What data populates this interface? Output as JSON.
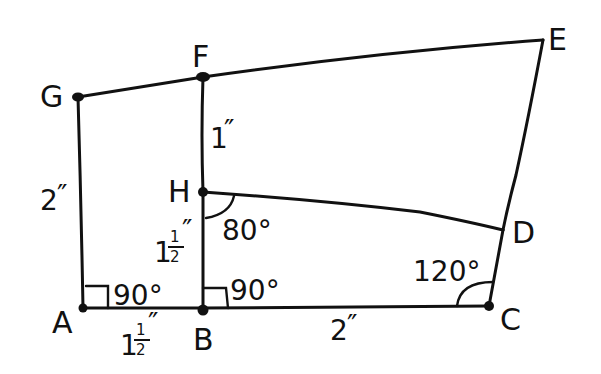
{
  "diagram": {
    "type": "hand-drawn geometry figure",
    "colors": {
      "ink": "#111111",
      "background": "#ffffff"
    },
    "points": {
      "A": {
        "label": "A"
      },
      "B": {
        "label": "B"
      },
      "C": {
        "label": "C"
      },
      "D": {
        "label": "D"
      },
      "E": {
        "label": "E"
      },
      "F": {
        "label": "F"
      },
      "G": {
        "label": "G"
      },
      "H": {
        "label": "H"
      }
    },
    "segments": [
      {
        "from": "G",
        "to": "F"
      },
      {
        "from": "F",
        "to": "E"
      },
      {
        "from": "E",
        "to": "D"
      },
      {
        "from": "D",
        "to": "C"
      },
      {
        "from": "C",
        "to": "B"
      },
      {
        "from": "B",
        "to": "A"
      },
      {
        "from": "A",
        "to": "G"
      },
      {
        "from": "F",
        "to": "H"
      },
      {
        "from": "H",
        "to": "B"
      },
      {
        "from": "H",
        "to": "D"
      }
    ],
    "lengths": {
      "AG": {
        "whole": "2",
        "mark": "″"
      },
      "FH": {
        "whole": "1",
        "mark": "″"
      },
      "HB": {
        "whole": "1",
        "num": "1",
        "den": "2",
        "mark": "″"
      },
      "AB": {
        "whole": "1",
        "num": "1",
        "den": "2",
        "mark": "″"
      },
      "BC": {
        "whole": "2",
        "mark": "″"
      }
    },
    "angles": {
      "A": "90°",
      "B": "90°",
      "H": "80°",
      "C": "120°"
    }
  }
}
